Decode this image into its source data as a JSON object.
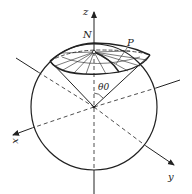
{
  "diagram": {
    "labels": {
      "z_axis": "z",
      "x_axis": "x",
      "y_axis": "y",
      "north_pole": "N",
      "point": "P",
      "angle": "θ0"
    },
    "colors": {
      "stroke": "#222222",
      "background": "#ffffff"
    }
  }
}
